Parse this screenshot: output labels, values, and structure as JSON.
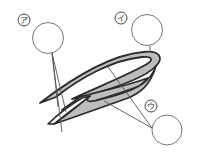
{
  "diagram": {
    "type": "labeled cross-section illustration",
    "colors": {
      "background": "#ffffff",
      "outline": "#2a2a2a",
      "fill": "#bdbdbd",
      "leader_line": "#555555",
      "answer_circle": "#777777"
    },
    "labels": [
      {
        "id": "a",
        "text": "ア",
        "label_pos": [
          24,
          20
        ],
        "answer_circle": [
          48,
          38
        ]
      },
      {
        "id": "i",
        "text": "イ",
        "label_pos": [
          121,
          18
        ],
        "answer_circle": [
          147,
          30
        ]
      },
      {
        "id": "u",
        "text": "ウ",
        "label_pos": [
          151,
          106
        ],
        "answer_circle": [
          167,
          130
        ]
      }
    ]
  }
}
